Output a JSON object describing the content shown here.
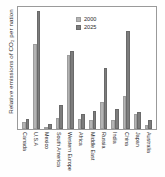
{
  "chart_data": {
    "type": "bar",
    "title": "",
    "subtitle": "",
    "xlabel": "",
    "ylabel": "Relative emissions of CO₂ per nation",
    "ylim": [
      0,
      100
    ],
    "grid": false,
    "legend_position": "top-center",
    "categories": [
      "Canada",
      "U.S.A",
      "Mexico",
      "South America",
      "Western Europe",
      "Africa",
      "Middle East",
      "Russia",
      "India",
      "China",
      "Japan",
      "Australia"
    ],
    "series": [
      {
        "name": "2000",
        "color": "#b4b4b4",
        "values": [
          6,
          70,
          2,
          9,
          61,
          8,
          7,
          22,
          7,
          27,
          12,
          3
        ]
      },
      {
        "name": "2025",
        "color": "#7d7d7d",
        "values": [
          8,
          97,
          4,
          20,
          64,
          12,
          15,
          50,
          16,
          80,
          14,
          7
        ]
      }
    ],
    "annotations": []
  },
  "legend": {
    "entries": [
      {
        "label": "2000",
        "swatch": "legend-swatch-2000"
      },
      {
        "label": "2025",
        "swatch": "legend-swatch-2025"
      }
    ]
  },
  "colors": {
    "series_2000": "#b4b4b4",
    "series_2025": "#7d7d7d",
    "frame": "#9a9a9a",
    "text": "#2b2b2b",
    "background": "#ffffff"
  }
}
